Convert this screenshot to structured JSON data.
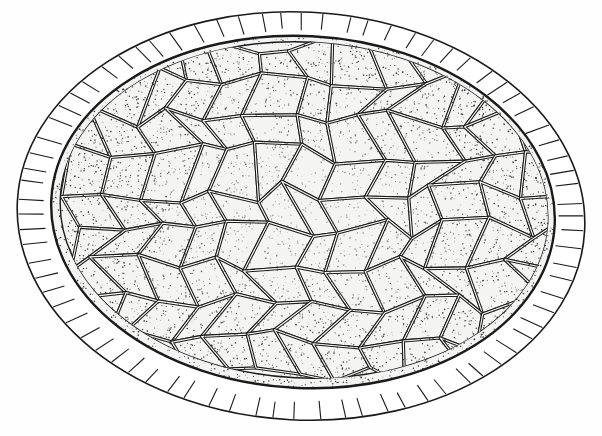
{
  "figure": {
    "width": 602,
    "height": 436,
    "colors": {
      "background": "#fefefe",
      "ink": "#1a1a1a",
      "cell_fill": "#f4f4f2",
      "band_fill": "#ffffff",
      "stipple": "#2a2a2a"
    },
    "outer_band": {
      "cx": 301,
      "cy": 216,
      "rx": 284,
      "ry": 204,
      "rotate": 3
    },
    "inner_band": {
      "cx": 303,
      "cy": 212,
      "rx": 252,
      "ry": 176,
      "rotate": 3
    },
    "cell_region": {
      "cx": 304,
      "cy": 210,
      "rx": 244,
      "ry": 168,
      "rotate": 3
    },
    "radial_line_count": 78,
    "cell_grid": {
      "cols": 13,
      "rows": 9,
      "jitter": 0.32
    },
    "stipple_density": 5200,
    "seed": 7
  }
}
